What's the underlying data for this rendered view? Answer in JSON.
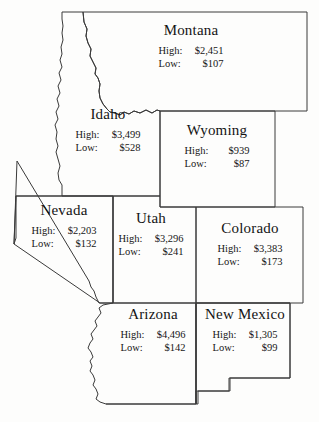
{
  "map": {
    "title": "Western United States Retail Sales Map",
    "background_color": "#fdfdfc",
    "border_color": "#3a3a3a",
    "text_color": "#141414",
    "labels": {
      "high": "High:",
      "low": "Low:"
    },
    "states": [
      {
        "id": "montana",
        "name": "Montana",
        "high": "$2,451",
        "low": "$107"
      },
      {
        "id": "idaho",
        "name": "Idaho",
        "high": "$3,499",
        "low": "$528"
      },
      {
        "id": "wyoming",
        "name": "Wyoming",
        "high": "$939",
        "low": "$87"
      },
      {
        "id": "nevada",
        "name": "Nevada",
        "high": "$2,203",
        "low": "$132"
      },
      {
        "id": "utah",
        "name": "Utah",
        "high": "$3,296",
        "low": "$241"
      },
      {
        "id": "colorado",
        "name": "Colorado",
        "high": "$3,383",
        "low": "$173"
      },
      {
        "id": "arizona",
        "name": "Arizona",
        "high": "$4,496",
        "low": "$142"
      },
      {
        "id": "new_mexico",
        "name": "New Mexico",
        "high": "$1,305",
        "low": "$99"
      }
    ]
  }
}
